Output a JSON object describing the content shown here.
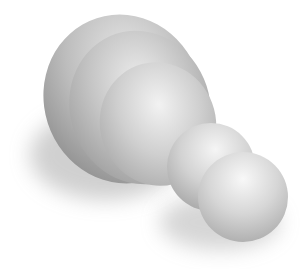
{
  "image": {
    "description": "3D rendered grayscale shapes: a large ridged dome and two smaller overlapping spheres with soft drop shadows",
    "background_color": "#ffffff",
    "colors": {
      "highlight": "#f2f2f2",
      "midtone": "#c4c4c4",
      "shade": "#8d8d8d",
      "shadow": "#b0b0b0"
    }
  }
}
